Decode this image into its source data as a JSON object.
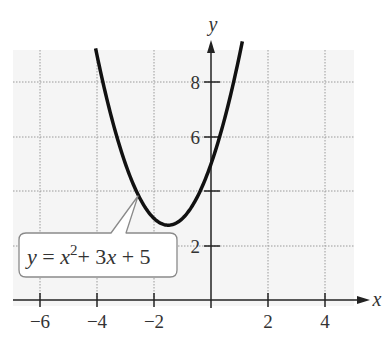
{
  "chart_data": {
    "type": "line",
    "title": "",
    "xlabel": "x",
    "ylabel": "y",
    "xlim": [
      -7,
      5
    ],
    "ylim": [
      -0.5,
      9.2
    ],
    "grid": true,
    "x_ticks": [
      -6,
      -4,
      -2,
      2,
      4
    ],
    "x_tick_labels": [
      "−6",
      "−4",
      "−2",
      "2",
      "4"
    ],
    "y_ticks": [
      2,
      4,
      6,
      8
    ],
    "y_tick_labels": [
      "2",
      "",
      "6",
      "8"
    ],
    "series": [
      {
        "name": "y = x^2 + 3x + 5",
        "equation": "y = x^2 + 3x + 5",
        "coefficients": {
          "a": 1,
          "b": 3,
          "c": 5
        },
        "vertex": [
          -1.5,
          2.75
        ],
        "x": [
          -4.05,
          -3.5,
          -3,
          -2.5,
          -2,
          -1.5,
          -1,
          -0.5,
          0,
          0.5,
          1.1
        ],
        "values": [
          9.25,
          6.75,
          5,
          3.75,
          3,
          2.75,
          3,
          3.75,
          5,
          6.75,
          9.51
        ]
      }
    ],
    "annotations": [
      {
        "text": "y = x² + 3x + 5",
        "type": "callout",
        "points_to": [
          -2.6,
          4.0
        ]
      }
    ],
    "legend": "none"
  },
  "labels": {
    "x_axis": "x",
    "y_axis": "y",
    "callout": {
      "y": "y",
      "eq": " = ",
      "x": "x",
      "sup": "2",
      "rest1": "+ 3",
      "x2": "x",
      "rest2": " + 5"
    },
    "ticks_x": [
      "−6",
      "−4",
      "−2",
      "2",
      "4"
    ],
    "ticks_y": [
      "8",
      "6",
      "2"
    ]
  },
  "colors": {
    "plot_bg": "#f5f5f5",
    "grid": "#9a9a9a",
    "axis": "#222222",
    "curve": "#111111",
    "callout_border": "#8a8a8a"
  }
}
